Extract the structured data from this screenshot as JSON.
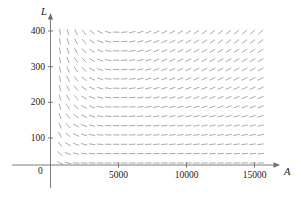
{
  "chart_data": {
    "type": "line",
    "title": "",
    "subtitle": "",
    "plot_kind": "slope-field",
    "xlabel": "A",
    "ylabel": "L",
    "xlim": [
      0,
      16200
    ],
    "ylim": [
      0,
      440
    ],
    "grid": false,
    "legend": null,
    "annotations": [],
    "axis_origin_label": "0",
    "x_ticks": [
      {
        "value": 5000,
        "label": "5000"
      },
      {
        "value": 10000,
        "label": "10000"
      },
      {
        "value": 15000,
        "label": "15000"
      }
    ],
    "y_ticks": [
      {
        "value": 100,
        "label": "100"
      },
      {
        "value": 200,
        "label": "200"
      },
      {
        "value": 300,
        "label": "300"
      },
      {
        "value": 400,
        "label": "400"
      }
    ],
    "field": {
      "description": "direction field of a predator-prey system, segments rotate counterclockwise about the center",
      "center_x": 5000,
      "center_y": 200,
      "segment_color": "#9a9a9a",
      "segment_length": 6.4,
      "x_start": 700,
      "x_step": 590,
      "x_count": 26,
      "y_start": 30,
      "y_step": 26.2,
      "y_count": 15,
      "model": "lotka-volterra",
      "params": {
        "a": 0.0022,
        "b": 1.1e-06,
        "c": 0.00105,
        "d": 2.1e-07
      }
    }
  },
  "style": {
    "axis_color": "#6e6e6e",
    "text_color": "#1a1a1a",
    "background": "#ffffff"
  }
}
